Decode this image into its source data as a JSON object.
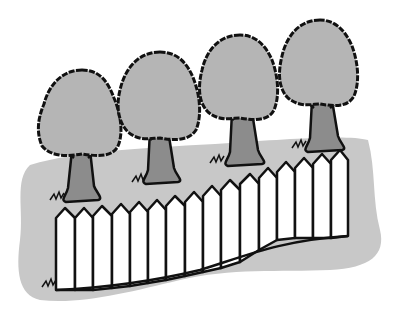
{
  "scene": {
    "title": "Trees behind a white picket fence",
    "colors": {
      "background": "#ffffff",
      "ground": "#c8c8c8",
      "foliage": "#b5b5b5",
      "trunk": "#8c8c8c",
      "fence": "#ffffff",
      "outline": "#111111"
    },
    "trees": [
      {
        "name": "tree-1",
        "cx": 82,
        "top": 70,
        "w": 78,
        "h": 90
      },
      {
        "name": "tree-2",
        "cx": 158,
        "top": 52,
        "w": 80,
        "h": 90
      },
      {
        "name": "tree-3",
        "cx": 239,
        "top": 35,
        "w": 78,
        "h": 88
      },
      {
        "name": "tree-4",
        "cx": 318,
        "top": 20,
        "w": 78,
        "h": 90
      }
    ],
    "fence": {
      "picket_count": 16
    }
  }
}
